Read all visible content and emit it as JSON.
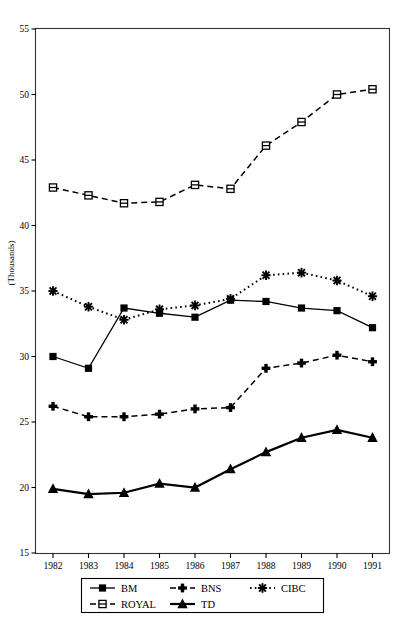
{
  "chart_data": {
    "type": "line",
    "title": "",
    "subtitle": "",
    "xlabel": "",
    "ylabel": "(Thousands)",
    "x": [
      1982,
      1983,
      1984,
      1985,
      1986,
      1987,
      1988,
      1989,
      1990,
      1991
    ],
    "categories": [
      "1982",
      "1983",
      "1984",
      "1985",
      "1986",
      "1987",
      "1988",
      "1989",
      "1990",
      "1991"
    ],
    "xlim": [
      1981.6,
      1991.4
    ],
    "ylim": [
      15,
      55
    ],
    "yticks": [
      15,
      20,
      25,
      30,
      35,
      40,
      45,
      50,
      55
    ],
    "ytick_labels": [
      "15",
      "20",
      "25",
      "30",
      "35",
      "40",
      "45",
      "50",
      "55"
    ],
    "grid": false,
    "legend_position": "bottom",
    "series": [
      {
        "name": "BM",
        "marker": "filled-square",
        "linestyle": "solid",
        "color": "#000000",
        "values": [
          30.0,
          29.1,
          33.7,
          33.3,
          33.0,
          34.3,
          34.2,
          33.7,
          33.5,
          32.2
        ]
      },
      {
        "name": "BNS",
        "marker": "filled-plus",
        "linestyle": "dashed",
        "color": "#000000",
        "values": [
          26.2,
          25.4,
          25.4,
          25.6,
          26.0,
          26.1,
          29.1,
          29.5,
          30.1,
          29.6
        ]
      },
      {
        "name": "CIBC",
        "marker": "asterisk",
        "linestyle": "dotted",
        "color": "#000000",
        "values": [
          35.0,
          33.8,
          32.8,
          33.6,
          33.9,
          34.4,
          36.2,
          36.4,
          35.8,
          34.6
        ]
      },
      {
        "name": "ROYAL",
        "marker": "open-square",
        "linestyle": "dashed",
        "color": "#000000",
        "values": [
          42.9,
          42.3,
          41.7,
          41.8,
          43.1,
          42.8,
          46.1,
          47.9,
          50.0,
          50.4
        ]
      },
      {
        "name": "TD",
        "marker": "filled-triangle",
        "linestyle": "solid-thick",
        "color": "#000000",
        "values": [
          19.9,
          19.5,
          19.6,
          20.3,
          20.0,
          21.4,
          22.7,
          23.8,
          24.4,
          23.8
        ]
      }
    ],
    "legend_entries": [
      {
        "label": "BM",
        "marker": "filled-square",
        "linestyle": "solid"
      },
      {
        "label": "BNS",
        "marker": "filled-plus",
        "linestyle": "dashed"
      },
      {
        "label": "CIBC",
        "marker": "asterisk",
        "linestyle": "dotted"
      },
      {
        "label": "ROYAL",
        "marker": "open-square",
        "linestyle": "dashed"
      },
      {
        "label": "TD",
        "marker": "filled-triangle",
        "linestyle": "solid-thick"
      }
    ]
  },
  "axes": {
    "y_axis_title": "(Thousands)",
    "y_ticks": [
      "55",
      "50",
      "45",
      "40",
      "35",
      "30",
      "25",
      "20",
      "15"
    ],
    "x_ticks": [
      "1982",
      "1983",
      "1984",
      "1985",
      "1986",
      "1987",
      "1988",
      "1989",
      "1990",
      "1991"
    ]
  },
  "legend": {
    "row1": [
      "BM",
      "BNS",
      "CIBC"
    ],
    "row2": [
      "ROYAL",
      "TD"
    ]
  }
}
